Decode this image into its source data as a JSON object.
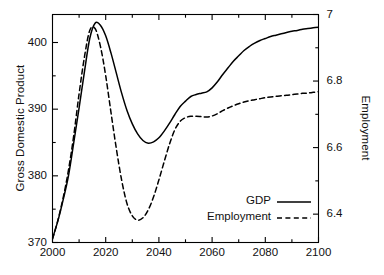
{
  "chart_data": {
    "type": "line",
    "title": "",
    "xlabel": "",
    "ylabel": "Gross Domestic Product",
    "y2label": "Employment",
    "xlim": [
      2000,
      2100
    ],
    "ylim": [
      370,
      404.2
    ],
    "y2lim": [
      6.3148,
      7.0
    ],
    "grid": false,
    "legend_position": "bottom-right",
    "xticks": [
      2000,
      2020,
      2040,
      2060,
      2080,
      2100
    ],
    "xtick_labels": [
      "2000",
      "2020",
      "2040",
      "2060",
      "2080",
      "2100"
    ],
    "xminorticks": [
      2010,
      2030,
      2050,
      2070,
      2090
    ],
    "yticks": [
      370,
      380,
      390,
      400
    ],
    "ytick_labels": [
      "370",
      "380",
      "390",
      "400"
    ],
    "yminorticks": [
      375,
      385,
      395
    ],
    "y2ticks": [
      6.4,
      6.6,
      6.8,
      7
    ],
    "y2tick_labels": [
      "6.4",
      "6.6",
      "6.8",
      "7"
    ],
    "y2minorticks": [
      6.5,
      6.7,
      6.9
    ],
    "series": [
      {
        "name": "GDP",
        "axis": "left",
        "style": "solid",
        "color": "#000000",
        "x": [
          2000,
          2002,
          2004,
          2006,
          2008,
          2010,
          2012,
          2014,
          2016,
          2018,
          2020,
          2022,
          2024,
          2026,
          2028,
          2030,
          2032,
          2034,
          2036,
          2038,
          2040,
          2042,
          2044,
          2046,
          2048,
          2050,
          2052,
          2054,
          2056,
          2058,
          2060,
          2062,
          2064,
          2066,
          2068,
          2070,
          2072,
          2074,
          2076,
          2078,
          2080,
          2082,
          2084,
          2086,
          2088,
          2090,
          2092,
          2094,
          2096,
          2098,
          2100
        ],
        "y": [
          370.6,
          373.2,
          376.4,
          380.0,
          385.0,
          390.2,
          395.6,
          400.6,
          402.9,
          402.6,
          401.0,
          398.4,
          395.4,
          392.4,
          389.8,
          387.8,
          386.3,
          385.3,
          384.9,
          385.1,
          385.7,
          386.7,
          387.9,
          389.2,
          390.4,
          391.2,
          391.9,
          392.2,
          392.4,
          392.6,
          393.2,
          394.1,
          395.2,
          396.2,
          397.2,
          398.0,
          398.8,
          399.4,
          399.9,
          400.3,
          400.6,
          400.9,
          401.1,
          401.3,
          401.5,
          401.7,
          401.8,
          402.0,
          402.1,
          402.2,
          402.3
        ]
      },
      {
        "name": "Employment",
        "axis": "right",
        "style": "dashed",
        "color": "#000000",
        "x": [
          2000,
          2002,
          2004,
          2006,
          2008,
          2010,
          2012,
          2014,
          2016,
          2018,
          2020,
          2022,
          2024,
          2026,
          2028,
          2030,
          2032,
          2034,
          2036,
          2038,
          2040,
          2042,
          2044,
          2046,
          2048,
          2050,
          2052,
          2054,
          2056,
          2058,
          2060,
          2062,
          2064,
          2066,
          2068,
          2070,
          2072,
          2074,
          2076,
          2078,
          2080,
          2082,
          2084,
          2086,
          2088,
          2090,
          2092,
          2094,
          2096,
          2098,
          2100
        ],
        "y": [
          6.325,
          6.381,
          6.449,
          6.532,
          6.637,
          6.762,
          6.872,
          6.952,
          6.958,
          6.905,
          6.816,
          6.705,
          6.597,
          6.502,
          6.432,
          6.395,
          6.382,
          6.389,
          6.413,
          6.452,
          6.503,
          6.558,
          6.611,
          6.654,
          6.679,
          6.69,
          6.694,
          6.694,
          6.693,
          6.692,
          6.695,
          6.702,
          6.711,
          6.719,
          6.726,
          6.732,
          6.737,
          6.741,
          6.744,
          6.747,
          6.75,
          6.752,
          6.754,
          6.756,
          6.757,
          6.759,
          6.761,
          6.763,
          6.764,
          6.766,
          6.768
        ]
      }
    ],
    "legend": [
      {
        "label": "GDP",
        "style": "solid"
      },
      {
        "label": "Employment",
        "style": "dashed"
      }
    ]
  }
}
